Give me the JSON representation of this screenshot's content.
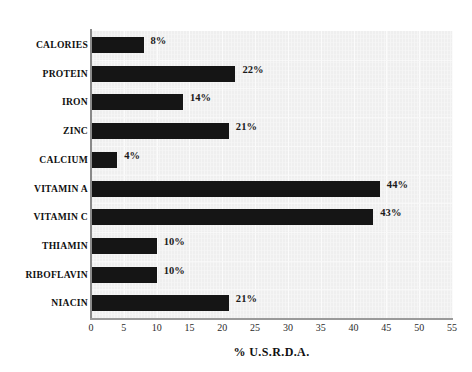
{
  "chart_data": {
    "type": "bar",
    "orientation": "horizontal",
    "title": "",
    "xlabel": "% U.S.R.D.A.",
    "ylabel": "",
    "xlim": [
      0,
      55
    ],
    "xticks": [
      0,
      5,
      10,
      15,
      20,
      25,
      30,
      35,
      40,
      45,
      50,
      55
    ],
    "grid": true,
    "legend": "none",
    "bar_color": "#151515",
    "panel_color": "#efefef",
    "categories": [
      "CALORIES",
      "PROTEIN",
      "IRON",
      "ZINC",
      "CALCIUM",
      "VITAMIN A",
      "VITAMIN C",
      "THIAMIN",
      "RIBOFLAVIN",
      "NIACIN"
    ],
    "values": [
      8,
      22,
      14,
      21,
      4,
      44,
      43,
      10,
      10,
      21
    ],
    "data_labels": [
      "8%",
      "22%",
      "14%",
      "21%",
      "4%",
      "44%",
      "43%",
      "10%",
      "10%",
      "21%"
    ],
    "tick_labels": [
      "0",
      "5",
      "10",
      "15",
      "20",
      "25",
      "30",
      "35",
      "40",
      "45",
      "50",
      "55"
    ]
  }
}
